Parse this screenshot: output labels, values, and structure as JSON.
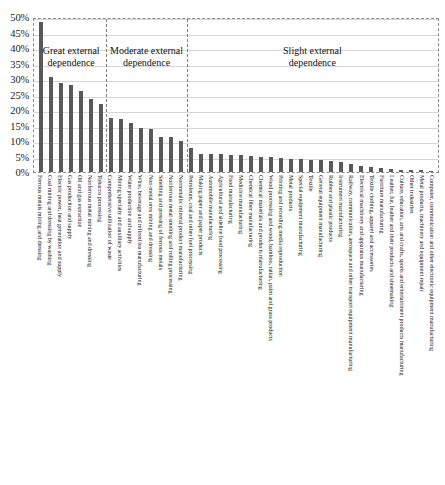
{
  "chart_data": {
    "type": "bar",
    "title": "",
    "subtitle": "",
    "xlabel": "",
    "ylabel": "",
    "ylim": [
      0,
      50
    ],
    "ytick_labels": [
      "50%",
      "45%",
      "40%",
      "35%",
      "30%",
      "25%",
      "20%",
      "15%",
      "10%",
      "5%",
      "0%"
    ],
    "ytick_values": [
      50,
      45,
      40,
      35,
      30,
      25,
      20,
      15,
      10,
      5,
      0
    ],
    "grid": true,
    "legend": "none",
    "bar_color": "#595959",
    "categories": [
      "Ferrous metals mining and dressing",
      "Coal mining and dressing by washing",
      "Electric power, heat generation and supply",
      "Gas production and supply",
      "Oil and gas extraction",
      "Nonferrous metal mining and dressing",
      "Tobacco processing",
      "Comprehensive utilization of waste",
      "Mining specialty and auxiliary activities",
      "Water production and supply",
      "Wine, beverage and refined tea manufacturing",
      "Non-metal ores mining and dressing",
      "Smelting and pressing of ferrous metals",
      "Nonferrous metal smelting and rolling processing",
      "Nonmetallic mineral product manufacturing",
      "Petroleum, coal and other fuel processing",
      "Making paper and paper products",
      "Automobile manufacturing",
      "Agricultural and sideline food processing",
      "Food manufacturing",
      "Medicine manufacturing",
      "Chemical fiber manufacturing",
      "Chemical materials and products manufacturing",
      "Wood processing and wood, bamboo, rattan, palm and grass products",
      "Printing and recording media reproduction",
      "Metal products",
      "Special equipment manufacturing",
      "Textile",
      "General equipment manufacturing",
      "Rubber and plastic products",
      "Instrument manufacturing",
      "Railway, communication, aerospace and other transport equipment manufacturing",
      "Electrical machinery and apparatus manufacturing",
      "Textile clothing, apparel and accessories",
      "Furniture manufacturing",
      "Leather, fur, feather and their products and shoemaking",
      "Culture, education, arts and crafts, sports and entertainment products manufacturing",
      "Other industries",
      "Metal products, machinery and equipment repair",
      "Computer, communication and other electronic equipment manufacturing"
    ],
    "values": [
      49.0,
      31.0,
      29.0,
      28.5,
      26.5,
      23.8,
      22.1,
      17.6,
      17.4,
      16.1,
      14.4,
      14.1,
      11.6,
      11.6,
      10.2,
      8.0,
      6.0,
      6.0,
      5.8,
      5.6,
      5.4,
      5.2,
      5.0,
      4.8,
      4.6,
      4.4,
      4.2,
      4.0,
      3.8,
      3.6,
      3.2,
      2.6,
      2.0,
      1.6,
      1.2,
      1.0,
      0.8,
      0.6,
      0.5,
      0.4
    ],
    "sections": [
      {
        "label": "Great external\ndependence",
        "line1": "Great external",
        "line2": "dependence",
        "start": 0,
        "end": 6
      },
      {
        "label": "Moderate external\ndependence",
        "line1": "Moderate external",
        "line2": "dependence",
        "start": 7,
        "end": 14
      },
      {
        "label": "Slight external\ndependence",
        "line1": "Slight external",
        "line2": "dependence",
        "start": 15,
        "end": 39
      }
    ]
  }
}
